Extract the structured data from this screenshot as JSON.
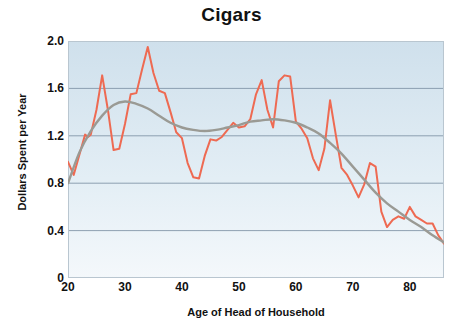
{
  "chart_data": {
    "type": "line",
    "title": "Cigars",
    "xlabel": "Age of Head of Household",
    "ylabel": "Dollars Spent per Year",
    "xlim": [
      20,
      86
    ],
    "ylim": [
      0,
      2.0
    ],
    "xticks": [
      20,
      30,
      40,
      50,
      60,
      70,
      80
    ],
    "xtick_labels": [
      "20",
      "30",
      "40",
      "50",
      "60",
      "70",
      "80"
    ],
    "yticks": [
      0,
      0.4,
      0.8,
      1.2,
      1.6,
      2.0
    ],
    "ytick_labels": [
      "0",
      "0.4",
      "0.8",
      "1.2",
      "1.6",
      "2.0"
    ],
    "grid": "horizontal",
    "legend": "none",
    "plot_background": "light-blue-vertical-gradient",
    "colors": {
      "raw_series": "#ee6a52",
      "smooth_series": "#9a9a94",
      "gridline": "#7f93a6",
      "plot_bg_top": "#cfe0ec",
      "plot_bg_bottom": "#f4f8fb",
      "text": "#111111"
    },
    "series": [
      {
        "name": "Dollars spent per year (raw)",
        "type": "line",
        "color": "#ee6a52",
        "x": [
          20,
          21,
          22,
          23,
          23.5,
          24,
          25,
          26,
          27,
          28,
          29,
          30,
          31,
          32,
          33,
          34,
          35,
          36,
          37,
          38,
          39,
          40,
          41,
          42,
          43,
          44,
          45,
          46,
          47,
          48,
          49,
          50,
          51,
          52,
          53,
          54,
          55,
          56,
          57,
          58,
          59,
          60,
          61,
          62,
          63,
          64,
          65,
          66,
          67,
          68,
          69,
          70,
          71,
          72,
          73,
          74,
          75,
          76,
          77,
          78,
          79,
          80,
          81,
          82,
          83,
          84,
          85,
          86
        ],
        "y": [
          0.98,
          0.87,
          1.04,
          1.21,
          1.19,
          1.21,
          1.42,
          1.71,
          1.42,
          1.08,
          1.09,
          1.3,
          1.55,
          1.56,
          1.76,
          1.95,
          1.73,
          1.58,
          1.56,
          1.4,
          1.23,
          1.18,
          0.97,
          0.85,
          0.84,
          1.03,
          1.17,
          1.16,
          1.19,
          1.25,
          1.31,
          1.27,
          1.28,
          1.34,
          1.55,
          1.67,
          1.42,
          1.27,
          1.66,
          1.71,
          1.7,
          1.32,
          1.26,
          1.18,
          1.01,
          0.91,
          1.09,
          1.5,
          1.21,
          0.93,
          0.87,
          0.78,
          0.68,
          0.79,
          0.97,
          0.94,
          0.56,
          0.43,
          0.49,
          0.52,
          0.5,
          0.6,
          0.52,
          0.49,
          0.46,
          0.46,
          0.36,
          0.29
        ]
      },
      {
        "name": "Smoothed trend",
        "type": "line",
        "color": "#9a9a94",
        "x": [
          20,
          22,
          24,
          26,
          28,
          30,
          32,
          34,
          36,
          38,
          40,
          42,
          44,
          46,
          48,
          50,
          52,
          54,
          56,
          58,
          60,
          62,
          64,
          66,
          68,
          70,
          72,
          74,
          76,
          78,
          80,
          82,
          84,
          86
        ],
        "y": [
          0.8,
          1.06,
          1.24,
          1.37,
          1.46,
          1.49,
          1.47,
          1.43,
          1.37,
          1.31,
          1.27,
          1.25,
          1.24,
          1.25,
          1.27,
          1.29,
          1.32,
          1.33,
          1.34,
          1.33,
          1.31,
          1.27,
          1.22,
          1.14,
          1.05,
          0.94,
          0.83,
          0.72,
          0.63,
          0.56,
          0.49,
          0.43,
          0.36,
          0.3
        ]
      }
    ]
  }
}
